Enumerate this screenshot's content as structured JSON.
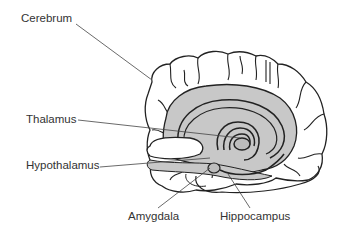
{
  "diagram": {
    "type": "anatomy",
    "colors": {
      "outline": "#222222",
      "limbic_fill": "#c8c8c8",
      "leader_line": "#444444",
      "text": "#333333",
      "background": "#ffffff"
    },
    "labels": [
      {
        "id": "cerebrum",
        "text": "Cerebrum"
      },
      {
        "id": "thalamus",
        "text": "Thalamus"
      },
      {
        "id": "hypothalamus",
        "text": "Hypothalamus"
      },
      {
        "id": "amygdala",
        "text": "Amygdala"
      },
      {
        "id": "hippocampus",
        "text": "Hippocampus"
      }
    ]
  }
}
